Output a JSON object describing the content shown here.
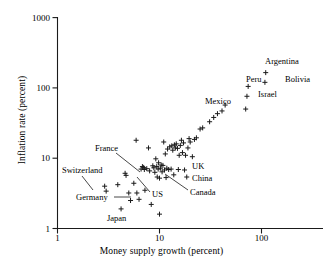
{
  "chart_data": {
    "type": "scatter",
    "title": "",
    "xlabel": "Money supply growth (percent)",
    "ylabel": "Inflation rate (percent)",
    "xscale": "log",
    "yscale": "log",
    "xlim": [
      1,
      260
    ],
    "ylim": [
      1,
      1000
    ],
    "grid": false,
    "legend": "none",
    "xticks": [
      "1",
      "10",
      "100"
    ],
    "xtick_values": [
      1,
      10,
      100
    ],
    "yticks": [
      "1",
      "10",
      "100",
      "1000"
    ],
    "ytick_values": [
      1,
      10,
      100,
      1000
    ],
    "marker": "+",
    "points": [
      {
        "x": 2.9,
        "y": 4.0
      },
      {
        "x": 3.0,
        "y": 3.4
      },
      {
        "x": 3.9,
        "y": 4.2
      },
      {
        "x": 4.2,
        "y": 1.9
      },
      {
        "x": 4.6,
        "y": 6.1
      },
      {
        "x": 4.7,
        "y": 5.7
      },
      {
        "x": 5.0,
        "y": 3.2
      },
      {
        "x": 5.2,
        "y": 2.5
      },
      {
        "x": 5.6,
        "y": 4.4
      },
      {
        "x": 5.9,
        "y": 18.0
      },
      {
        "x": 6.0,
        "y": 3.2
      },
      {
        "x": 6.3,
        "y": 2.6
      },
      {
        "x": 6.6,
        "y": 7.0
      },
      {
        "x": 6.8,
        "y": 7.6
      },
      {
        "x": 7.0,
        "y": 7.4
      },
      {
        "x": 7.1,
        "y": 6.9
      },
      {
        "x": 7.2,
        "y": 3.5
      },
      {
        "x": 7.5,
        "y": 7.1
      },
      {
        "x": 7.8,
        "y": 14.0
      },
      {
        "x": 8.0,
        "y": 6.6
      },
      {
        "x": 8.3,
        "y": 2.2
      },
      {
        "x": 8.6,
        "y": 7.8
      },
      {
        "x": 8.8,
        "y": 7.3
      },
      {
        "x": 9.0,
        "y": 6.3
      },
      {
        "x": 9.2,
        "y": 9.8
      },
      {
        "x": 9.4,
        "y": 7.6
      },
      {
        "x": 9.5,
        "y": 5.4
      },
      {
        "x": 9.7,
        "y": 7.0
      },
      {
        "x": 9.8,
        "y": 8.6
      },
      {
        "x": 10.0,
        "y": 5.2
      },
      {
        "x": 10.0,
        "y": 1.6
      },
      {
        "x": 10.2,
        "y": 7.2
      },
      {
        "x": 10.4,
        "y": 8.0
      },
      {
        "x": 10.6,
        "y": 6.4
      },
      {
        "x": 10.8,
        "y": 7.9
      },
      {
        "x": 11.0,
        "y": 17.0
      },
      {
        "x": 11.2,
        "y": 6.8
      },
      {
        "x": 11.4,
        "y": 11.5
      },
      {
        "x": 11.6,
        "y": 5.3
      },
      {
        "x": 11.8,
        "y": 7.2
      },
      {
        "x": 12.0,
        "y": 13.5
      },
      {
        "x": 12.3,
        "y": 6.9
      },
      {
        "x": 12.6,
        "y": 14.5
      },
      {
        "x": 13.0,
        "y": 7.0
      },
      {
        "x": 13.2,
        "y": 15.0
      },
      {
        "x": 13.5,
        "y": 13.0
      },
      {
        "x": 13.8,
        "y": 5.8
      },
      {
        "x": 14.0,
        "y": 15.5
      },
      {
        "x": 14.3,
        "y": 14.0
      },
      {
        "x": 14.6,
        "y": 16.0
      },
      {
        "x": 15.0,
        "y": 13.8
      },
      {
        "x": 15.3,
        "y": 6.9
      },
      {
        "x": 15.6,
        "y": 11.0
      },
      {
        "x": 16.0,
        "y": 15.2
      },
      {
        "x": 16.4,
        "y": 18.0
      },
      {
        "x": 16.8,
        "y": 12.0
      },
      {
        "x": 17.2,
        "y": 16.5
      },
      {
        "x": 17.6,
        "y": 6.8
      },
      {
        "x": 18.0,
        "y": 11.0
      },
      {
        "x": 18.5,
        "y": 5.4
      },
      {
        "x": 19.0,
        "y": 14.0
      },
      {
        "x": 19.5,
        "y": 19.0
      },
      {
        "x": 20.0,
        "y": 17.0
      },
      {
        "x": 21.0,
        "y": 10.5
      },
      {
        "x": 22.0,
        "y": 18.5
      },
      {
        "x": 23.0,
        "y": 19.5
      },
      {
        "x": 25.0,
        "y": 26.0
      },
      {
        "x": 26.5,
        "y": 27.0
      },
      {
        "x": 31.0,
        "y": 33.0
      },
      {
        "x": 34.0,
        "y": 38.0
      },
      {
        "x": 37.0,
        "y": 43.0
      },
      {
        "x": 41.0,
        "y": 47.0
      },
      {
        "x": 44.0,
        "y": 57.0
      },
      {
        "x": 70.0,
        "y": 50.0
      },
      {
        "x": 72.0,
        "y": 76.0
      },
      {
        "x": 74.0,
        "y": 105.0
      },
      {
        "x": 108.0,
        "y": 120.0
      },
      {
        "x": 110.0,
        "y": 165.0
      }
    ],
    "annotations": [
      {
        "label": "Argentina",
        "x": 265,
        "y": 57,
        "align": "left",
        "leader": false
      },
      {
        "label": "Bolivia",
        "x": 285,
        "y": 75,
        "align": "left",
        "leader": false
      },
      {
        "label": "Peru",
        "x": 246,
        "y": 75,
        "align": "left",
        "leader": false
      },
      {
        "label": "Israel",
        "x": 258,
        "y": 90,
        "align": "left",
        "leader": false
      },
      {
        "label": "Mexico",
        "x": 205,
        "y": 97,
        "align": "left",
        "leader": false
      },
      {
        "label": "UK",
        "x": 192,
        "y": 162,
        "align": "left",
        "leader": false
      },
      {
        "label": "China",
        "x": 192,
        "y": 174,
        "align": "left",
        "leader": false
      },
      {
        "label": "Canada",
        "x": 190,
        "y": 188,
        "align": "left",
        "leader": true
      },
      {
        "label": "US",
        "x": 152,
        "y": 190,
        "align": "left",
        "leader": true
      },
      {
        "label": "France",
        "x": 95,
        "y": 144,
        "align": "left",
        "leader": true
      },
      {
        "label": "Switzerland",
        "x": 62,
        "y": 166,
        "align": "left",
        "leader": true
      },
      {
        "label": "Germany",
        "x": 76,
        "y": 193,
        "align": "left",
        "leader": true
      },
      {
        "label": "Japan",
        "x": 107,
        "y": 214,
        "align": "left",
        "leader": false
      }
    ]
  },
  "axis": {
    "x_title": "Money supply growth (percent)",
    "y_title": "Inflation rate (percent)",
    "x_ticks": [
      "1",
      "10",
      "100"
    ],
    "y_ticks": [
      "1000",
      "100",
      "10",
      "1"
    ]
  },
  "labels": {
    "argentina": "Argentina",
    "bolivia": "Bolivia",
    "peru": "Peru",
    "israel": "Israel",
    "mexico": "Mexico",
    "uk": "UK",
    "china": "China",
    "canada": "Canada",
    "us": "US",
    "france": "France",
    "switzerland": "Switzerland",
    "germany": "Germany",
    "japan": "Japan"
  },
  "colors": {
    "ink": "#1a1a1a",
    "background": "#ffffff"
  }
}
